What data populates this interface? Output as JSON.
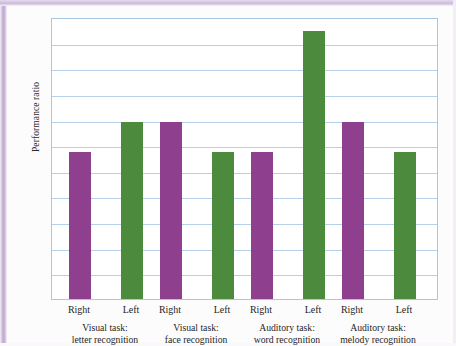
{
  "chart_data": {
    "type": "bar",
    "title": "",
    "xlabel": "",
    "ylabel": "Performance ratio",
    "ylim": [
      0,
      2.2
    ],
    "grid": true,
    "legend": "none",
    "ytick_labels": [
      "2.0",
      "1.8",
      "1.6",
      "1.4",
      "1.2",
      "1.0",
      ".8",
      ".6",
      ".4",
      ".2",
      "0"
    ],
    "ytick_values": [
      2.0,
      1.8,
      1.6,
      1.4,
      1.2,
      1.0,
      0.8,
      0.6,
      0.4,
      0.2,
      0
    ],
    "categories": [
      "Visual task: letter recognition",
      "Visual task: face recognition",
      "Auditory task: word recognition",
      "Auditory task: melody recognition"
    ],
    "groups": [
      {
        "label_line1": "Visual task:",
        "label_line2": "letter recognition",
        "bars": [
          {
            "tick": "Right",
            "ear": "right",
            "value": 1.15,
            "color": "#8e3f8d"
          },
          {
            "tick": "Left",
            "ear": "left",
            "value": 1.38,
            "color": "#4c8b3e"
          }
        ]
      },
      {
        "label_line1": "Visual task:",
        "label_line2": "face recognition",
        "bars": [
          {
            "tick": "Right",
            "ear": "right",
            "value": 1.38,
            "color": "#8e3f8d"
          },
          {
            "tick": "Left",
            "ear": "left",
            "value": 1.15,
            "color": "#4c8b3e"
          }
        ]
      },
      {
        "label_line1": "Auditory task:",
        "label_line2": "word recognition",
        "bars": [
          {
            "tick": "Right",
            "ear": "right",
            "value": 1.15,
            "color": "#8e3f8d"
          },
          {
            "tick": "Left",
            "ear": "left",
            "value": 2.09,
            "color": "#4c8b3e"
          }
        ]
      },
      {
        "label_line1": "Auditory task:",
        "label_line2": "melody recognition",
        "bars": [
          {
            "tick": "Right",
            "ear": "right",
            "value": 1.38,
            "color": "#8e3f8d"
          },
          {
            "tick": "Left",
            "ear": "left",
            "value": 1.15,
            "color": "#4c8b3e"
          }
        ]
      }
    ],
    "series": [
      {
        "name": "Right",
        "values": [
          1.15,
          1.38,
          1.15,
          1.38
        ]
      },
      {
        "name": "Left",
        "values": [
          1.38,
          1.15,
          2.09,
          1.15
        ]
      }
    ],
    "colors": {
      "right_bar": "#8e3f8d",
      "left_bar": "#4c8b3e",
      "gridline": "#b7d0e8",
      "frame": "#a9c6e2",
      "plot_background": "#ffffff",
      "text": "#1f1f1f"
    }
  }
}
